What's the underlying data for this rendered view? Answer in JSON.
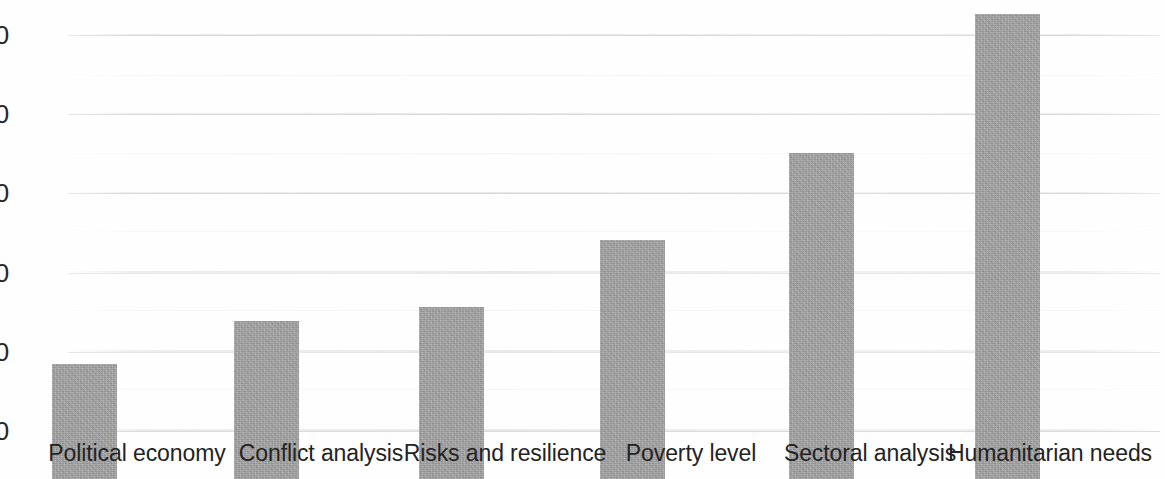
{
  "chart_data": {
    "type": "bar",
    "title": "",
    "subtitle": "",
    "xlabel": "",
    "ylabel": "",
    "categories": [
      "Political economy",
      "Conflict analysis",
      "Risks and resilience",
      "Poverty level",
      "Sectoral analysis",
      "Humanitarian needs"
    ],
    "values": [
      24,
      33,
      36,
      50,
      68,
      97
    ],
    "ylim": [
      0,
      100
    ],
    "ytick_labels": [
      "100",
      "80",
      "60",
      "40",
      "20",
      "0"
    ],
    "ytick_values": [
      100,
      80,
      60,
      40,
      20,
      0
    ],
    "grid": true,
    "legend": null,
    "series": [
      {
        "name": "",
        "values": [
          24,
          33,
          36,
          50,
          68,
          97
        ]
      }
    ],
    "bar_color": "#a3a3a3",
    "gridline_color": "#e9e9e9",
    "text_color": "#272727",
    "background_color": "#ffffff"
  }
}
